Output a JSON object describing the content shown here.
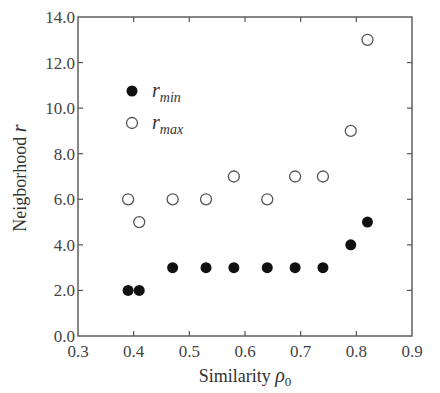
{
  "chart_data": {
    "type": "scatter",
    "title": "",
    "xlabel": "Similarity ρ0",
    "xlabel_main": "Similarity ",
    "xlabel_symbol": "ρ",
    "xlabel_sub": "0",
    "ylabel": "Neigborhood r",
    "ylabel_main": "Neigborhood ",
    "ylabel_symbol": "r",
    "xlim": [
      0.3,
      0.9
    ],
    "ylim": [
      0.0,
      14.0
    ],
    "xticks": [
      "0.3",
      "0.4",
      "0.5",
      "0.6",
      "0.7",
      "0.8",
      "0.9"
    ],
    "yticks": [
      "0.0",
      "2.0",
      "4.0",
      "6.0",
      "8.0",
      "10.0",
      "12.0",
      "14.0"
    ],
    "grid": false,
    "legend_position": "upper-left",
    "series": [
      {
        "name": "r_min",
        "label_main": "r",
        "label_sub": "min",
        "marker": "filled-circle",
        "color": "#111111",
        "x": [
          0.39,
          0.41,
          0.47,
          0.53,
          0.58,
          0.64,
          0.69,
          0.74,
          0.79,
          0.82
        ],
        "y": [
          2,
          2,
          3,
          3,
          3,
          3,
          3,
          3,
          4,
          5
        ]
      },
      {
        "name": "r_max",
        "label_main": "r",
        "label_sub": "max",
        "marker": "open-circle",
        "color": "#555555",
        "x": [
          0.39,
          0.41,
          0.47,
          0.53,
          0.58,
          0.64,
          0.69,
          0.74,
          0.79,
          0.82
        ],
        "y": [
          6,
          5,
          6,
          6,
          7,
          6,
          7,
          7,
          9,
          13
        ]
      }
    ]
  }
}
